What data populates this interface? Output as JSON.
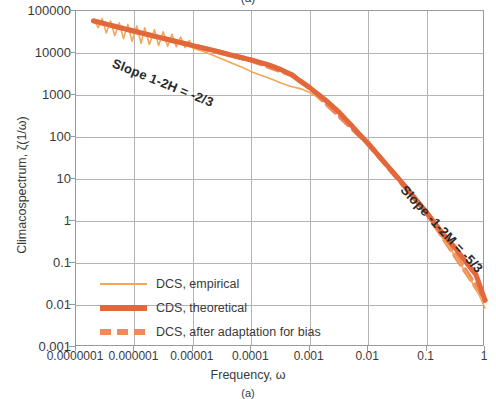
{
  "figure": {
    "caption_top": "(a)",
    "caption_bottom": "(a)"
  },
  "axes": {
    "x_title": "Frequency, ω",
    "y_title": "Climacospectrum, ζ(1/ω)",
    "x_ticks": [
      "0.0000001",
      "0.000001",
      "0.00001",
      "0.0001",
      "0.001",
      "0.01",
      "0.1",
      "1"
    ],
    "y_ticks": [
      "100000",
      "10000",
      "1000",
      "100",
      "10",
      "1",
      "0.1",
      "0.01",
      "0.001"
    ]
  },
  "legend": {
    "items": [
      {
        "label": "DCS, empirical",
        "color": "#f2a657",
        "style": "thin-solid"
      },
      {
        "label": "CDS, theoretical",
        "color": "#e2683c",
        "style": "thick-solid"
      },
      {
        "label": "DCS, after adaptation for bias",
        "color": "#f08a5d",
        "style": "dashed"
      }
    ]
  },
  "annotations": {
    "left_slope": "Slope 1-2H = -2/3",
    "right_slope": "Slope -1-2M = -5/3"
  },
  "chart_data": {
    "type": "line",
    "title": "",
    "xlabel": "Frequency, ω",
    "ylabel": "Climacospectrum, ζ(1/ω)",
    "xscale": "log",
    "yscale": "log",
    "xlim": [
      1e-07,
      1
    ],
    "ylim": [
      0.001,
      100000
    ],
    "x_tick_values": [
      1e-07,
      1e-06,
      1e-05,
      0.0001,
      0.001,
      0.01,
      0.1,
      1
    ],
    "y_tick_values": [
      100000,
      10000,
      1000,
      100,
      10,
      1,
      0.1,
      0.01,
      0.001
    ],
    "grid": true,
    "legend_position": "inside-lower-left",
    "annotations": [
      {
        "text": "Slope 1-2H = -2/3",
        "slope": -0.6667,
        "region": "low-frequency"
      },
      {
        "text": "Slope -1-2M = -5/3",
        "slope": -1.6667,
        "region": "high-frequency"
      }
    ],
    "series": [
      {
        "name": "DCS, empirical",
        "color": "#f2a657",
        "style": "thin-solid",
        "noisy": true,
        "points": [
          [
            2e-07,
            62000
          ],
          [
            2.4e-07,
            40000
          ],
          [
            2.8e-07,
            66000
          ],
          [
            3.3e-07,
            30000
          ],
          [
            3.9e-07,
            58000
          ],
          [
            4.6e-07,
            26000
          ],
          [
            5.5e-07,
            52000
          ],
          [
            6.5e-07,
            22000
          ],
          [
            7.7e-07,
            48000
          ],
          [
            9.1e-07,
            19000
          ],
          [
            1.1e-06,
            44000
          ],
          [
            1.3e-06,
            17000
          ],
          [
            1.5e-06,
            40000
          ],
          [
            1.8e-06,
            16000
          ],
          [
            2.2e-06,
            36000
          ],
          [
            2.6e-06,
            15000
          ],
          [
            3.1e-06,
            32000
          ],
          [
            3.7e-06,
            14500
          ],
          [
            4.4e-06,
            28000
          ],
          [
            5.2e-06,
            14000
          ],
          [
            6.2e-06,
            24000
          ],
          [
            7.3e-06,
            13500
          ],
          [
            8.7e-06,
            20000
          ],
          [
            1e-05,
            13000
          ],
          [
            1.5e-05,
            11000
          ],
          [
            2.2e-05,
            8800
          ],
          [
            3.3e-05,
            7000
          ],
          [
            4.8e-05,
            5600
          ],
          [
            7.1e-05,
            4500
          ],
          [
            0.0001,
            3600
          ],
          [
            0.00015,
            2900
          ],
          [
            0.00022,
            2400
          ],
          [
            0.00033,
            1900
          ],
          [
            0.00048,
            1600
          ],
          [
            0.00071,
            1400
          ],
          [
            0.001,
            1150
          ],
          [
            0.0015,
            820
          ],
          [
            0.0022,
            560
          ],
          [
            0.0033,
            360
          ],
          [
            0.0048,
            215
          ],
          [
            0.0071,
            125
          ],
          [
            0.01,
            72
          ],
          [
            0.015,
            40
          ],
          [
            0.022,
            21
          ],
          [
            0.033,
            11
          ],
          [
            0.048,
            5.5
          ],
          [
            0.071,
            2.7
          ],
          [
            0.1,
            1.35
          ],
          [
            0.15,
            0.62
          ],
          [
            0.22,
            0.29
          ],
          [
            0.33,
            0.13
          ],
          [
            0.48,
            0.057
          ],
          [
            0.71,
            0.024
          ],
          [
            1.0,
            0.0085
          ]
        ]
      },
      {
        "name": "CDS, theoretical",
        "color": "#e2683c",
        "style": "thick-solid",
        "points": [
          [
            2e-07,
            58000
          ],
          [
            5e-07,
            42000
          ],
          [
            1e-06,
            33000
          ],
          [
            2e-06,
            26000
          ],
          [
            5e-06,
            19000
          ],
          [
            1e-05,
            15000
          ],
          [
            2e-05,
            12000
          ],
          [
            5e-05,
            8600
          ],
          [
            0.0001,
            6800
          ],
          [
            0.0002,
            5200
          ],
          [
            0.0003,
            4200
          ],
          [
            0.0005,
            3000
          ],
          [
            0.0007,
            2100
          ],
          [
            0.001,
            1500
          ],
          [
            0.002,
            700
          ],
          [
            0.003,
            420
          ],
          [
            0.005,
            200
          ],
          [
            0.007,
            118
          ],
          [
            0.01,
            70
          ],
          [
            0.02,
            23
          ],
          [
            0.03,
            12
          ],
          [
            0.05,
            5.2
          ],
          [
            0.07,
            2.9
          ],
          [
            0.1,
            1.6
          ],
          [
            0.2,
            0.46
          ],
          [
            0.3,
            0.24
          ],
          [
            0.5,
            0.095
          ],
          [
            0.7,
            0.053
          ],
          [
            1.0,
            0.013
          ]
        ]
      },
      {
        "name": "DCS, after adaptation for bias",
        "color": "#f08a5d",
        "style": "dashed",
        "points": [
          [
            2e-07,
            58000
          ],
          [
            1e-06,
            33000
          ],
          [
            1e-05,
            15000
          ],
          [
            0.0001,
            6800
          ],
          [
            0.0005,
            3000
          ],
          [
            0.001,
            1500
          ],
          [
            0.01,
            70
          ],
          [
            0.1,
            1.6
          ],
          [
            1.0,
            0.013
          ]
        ]
      }
    ]
  }
}
